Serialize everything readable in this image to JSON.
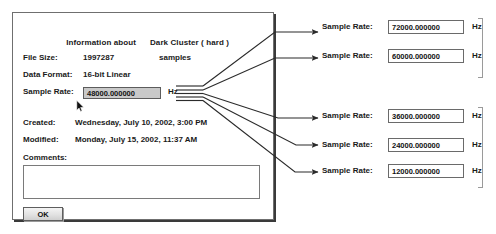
{
  "dialog": {
    "title_prefix": "Information about",
    "title_name": "Dark Cluster ( hard )",
    "file_size_label": "File Size:",
    "file_size_value": "1997287",
    "file_size_unit": "samples",
    "data_format_label": "Data Format:",
    "data_format_value": "16-bit Linear",
    "sample_rate_label": "Sample Rate:",
    "sample_rate_value": "48000.000000",
    "sample_rate_unit": "Hz",
    "created_label": "Created:",
    "created_value": "Wednesday, July 10, 2002, 3:00 PM",
    "modified_label": "Modified:",
    "modified_value": "Monday, July 15, 2002, 11:37 AM",
    "comments_label": "Comments:",
    "comments_value": "",
    "comments_placeholder": "",
    "ok_label": "OK"
  },
  "side_rows": [
    {
      "label": "Sample Rate:",
      "value": "72000.000000",
      "unit": "Hz"
    },
    {
      "label": "Sample Rate:",
      "value": "60000.000000",
      "unit": "Hz"
    },
    {
      "label": "Sample Rate:",
      "value": "36000.000000",
      "unit": "Hz"
    },
    {
      "label": "Sample Rate:",
      "value": "24000.000000",
      "unit": "Hz"
    },
    {
      "label": "Sample Rate:",
      "value": "12000.000000",
      "unit": "Hz"
    }
  ],
  "colors": {
    "dialog_border": "#6f6f6f",
    "field_selected_bg": "#c9c9c9",
    "arrow_stroke": "#2b2b2b",
    "bracket": "#9a9a9a",
    "page_bg": "#ffffff"
  }
}
